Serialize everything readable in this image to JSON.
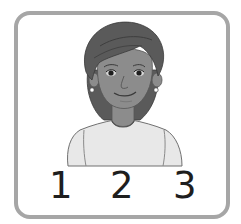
{
  "card": {
    "border_color": "#a6a6a6",
    "background": "#ffffff"
  },
  "illustration": {
    "subject": "woman-portrait",
    "skin_color": "#8c8c8c",
    "hair_color": "#5a5a5a",
    "shirt_color": "#e6e6e6"
  },
  "numbers": [
    {
      "label": "1"
    },
    {
      "label": "2"
    },
    {
      "label": "3"
    }
  ]
}
